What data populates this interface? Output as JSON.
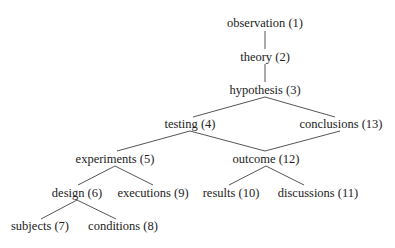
{
  "diagram": {
    "type": "hierarchy",
    "colors": {
      "text": "#222222",
      "edge": "#555555",
      "background": "#ffffff"
    },
    "nodes": [
      {
        "id": 1,
        "label": "observation (1)",
        "x": 265,
        "y": 23
      },
      {
        "id": 2,
        "label": "theory (2)",
        "x": 265,
        "y": 57
      },
      {
        "id": 3,
        "label": "hypothesis (3)",
        "x": 265,
        "y": 90
      },
      {
        "id": 4,
        "label": "testing (4)",
        "x": 190,
        "y": 124
      },
      {
        "id": 13,
        "label": "conclusions (13)",
        "x": 341,
        "y": 124
      },
      {
        "id": 5,
        "label": "experiments (5)",
        "x": 115,
        "y": 159
      },
      {
        "id": 12,
        "label": "outcome (12)",
        "x": 266,
        "y": 159
      },
      {
        "id": 6,
        "label": "design (6)",
        "x": 77,
        "y": 193
      },
      {
        "id": 9,
        "label": "executions (9)",
        "x": 153,
        "y": 193
      },
      {
        "id": 10,
        "label": "results (10)",
        "x": 231,
        "y": 193
      },
      {
        "id": 11,
        "label": "discussions (11)",
        "x": 318,
        "y": 193
      },
      {
        "id": 7,
        "label": "subjects (7)",
        "x": 40,
        "y": 226
      },
      {
        "id": 8,
        "label": "conditions (8)",
        "x": 123,
        "y": 226
      }
    ],
    "edges": [
      {
        "from": 1,
        "to": 2,
        "x1": 265,
        "y1": 31,
        "x2": 265,
        "y2": 49
      },
      {
        "from": 2,
        "to": 3,
        "x1": 265,
        "y1": 64,
        "x2": 265,
        "y2": 82
      },
      {
        "from": 3,
        "to": 4,
        "x1": 265,
        "y1": 97,
        "x2": 193,
        "y2": 117
      },
      {
        "from": 3,
        "to": 13,
        "x1": 265,
        "y1": 97,
        "x2": 335,
        "y2": 117
      },
      {
        "from": 4,
        "to": 5,
        "x1": 190,
        "y1": 131,
        "x2": 117,
        "y2": 151
      },
      {
        "from": 4,
        "to": 12,
        "x1": 190,
        "y1": 131,
        "x2": 265,
        "y2": 151
      },
      {
        "from": 13,
        "to": 12,
        "x1": 340,
        "y1": 131,
        "x2": 265,
        "y2": 151
      },
      {
        "from": 5,
        "to": 6,
        "x1": 115,
        "y1": 166,
        "x2": 78,
        "y2": 185
      },
      {
        "from": 5,
        "to": 9,
        "x1": 115,
        "y1": 166,
        "x2": 153,
        "y2": 185
      },
      {
        "from": 12,
        "to": 10,
        "x1": 266,
        "y1": 166,
        "x2": 229,
        "y2": 185
      },
      {
        "from": 12,
        "to": 11,
        "x1": 266,
        "y1": 166,
        "x2": 304,
        "y2": 185
      },
      {
        "from": 6,
        "to": 7,
        "x1": 77,
        "y1": 200,
        "x2": 41,
        "y2": 219
      },
      {
        "from": 6,
        "to": 8,
        "x1": 77,
        "y1": 200,
        "x2": 116,
        "y2": 219
      }
    ]
  }
}
